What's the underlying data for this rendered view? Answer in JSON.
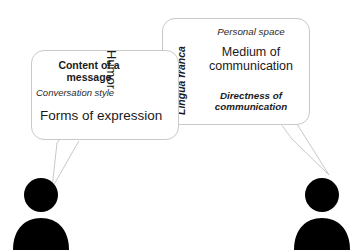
{
  "diagram": {
    "background_color": "#ffffff",
    "bubble_border_color": "#c9c9c9",
    "text_color": "#1a1a1a",
    "figure_color": "#000000"
  },
  "left_bubble": {
    "name": "left-speech-bubble",
    "lines": {
      "content_of_a_message": "Content of a message",
      "humor": "Humor",
      "conversation_style": "Conversation style",
      "forms_of_expression": "Forms of expression"
    }
  },
  "right_bubble": {
    "name": "right-speech-bubble",
    "lines": {
      "lingua_franca": "Lingua franca",
      "personal_space": "Personal space",
      "medium_of_communication": "Medium of communication",
      "directness_of_communication": "Directness of communication"
    }
  },
  "figures": {
    "left": "person-silhouette-left",
    "right": "person-silhouette-right"
  }
}
